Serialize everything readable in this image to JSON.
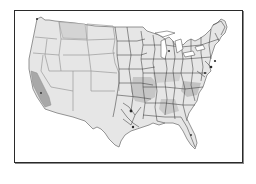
{
  "map": {
    "subject": "United States district boundaries map",
    "style": "grayscale",
    "colors": {
      "background": "#ffffff",
      "frame_border": "#2a2a2a",
      "land_fill": "#e6e6e6",
      "highlight_fill_light": "#d4d4d4",
      "highlight_fill_mid": "#c2c2c2",
      "highlight_fill_dark": "#a8a8a8",
      "boundary_west": "#9a9a9a",
      "boundary_east": "#3c3c3c"
    },
    "regions": [
      {
        "name": "montana-highlight",
        "shade": "light"
      },
      {
        "name": "southern-california-highlight",
        "shade": "dark"
      },
      {
        "name": "lower-mississippi-highlight",
        "shade": "mid"
      },
      {
        "name": "carolinas-highlight",
        "shade": "mid"
      }
    ]
  }
}
